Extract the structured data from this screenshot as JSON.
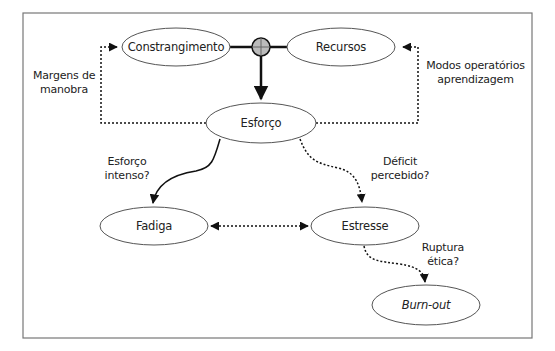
{
  "diagram": {
    "type": "flow-diagram",
    "frame": {
      "x": 23,
      "y": 13,
      "width": 509,
      "height": 325,
      "stroke": "#777777"
    },
    "nodes": [
      {
        "id": "constrangimento",
        "label": "Constrangimento",
        "cx": 176,
        "cy": 47,
        "rx": 54,
        "ry": 19
      },
      {
        "id": "recursos",
        "label": "Recursos",
        "cx": 341,
        "cy": 47,
        "rx": 54,
        "ry": 19
      },
      {
        "id": "esforco",
        "label": "Esforço",
        "cx": 261,
        "cy": 123,
        "rx": 55,
        "ry": 20
      },
      {
        "id": "fadiga",
        "label": "Fadiga",
        "cx": 154,
        "cy": 226,
        "rx": 54,
        "ry": 19
      },
      {
        "id": "estresse",
        "label": "Estresse",
        "cx": 365,
        "cy": 226,
        "rx": 54,
        "ry": 19
      },
      {
        "id": "burnout",
        "label": "Burn-out",
        "cx": 426,
        "cy": 305,
        "rx": 54,
        "ry": 20,
        "italic": true
      }
    ],
    "junction": {
      "cx": 261,
      "cy": 47,
      "r": 9,
      "fill": "#bbbbbb"
    },
    "edge_labels": {
      "margens": [
        "Margens de",
        "manobra"
      ],
      "modos": [
        "Modos operatórios",
        "aprendizagem"
      ],
      "esforco_intenso": [
        "Esforço",
        "intenso?"
      ],
      "deficit": [
        "Déficit",
        "percebido?"
      ],
      "ruptura": [
        "Ruptura",
        "ética?"
      ]
    },
    "edges": [
      {
        "from": "constrangimento",
        "to": "recursos",
        "style": "solid-thick",
        "via": "junction"
      },
      {
        "from": "junction",
        "to": "esforco",
        "style": "solid-thick",
        "arrow": "end"
      },
      {
        "from": "esforco",
        "to": "constrangimento",
        "style": "dotted",
        "label": "Margens de manobra",
        "arrow": "end"
      },
      {
        "from": "esforco",
        "to": "recursos",
        "style": "dotted",
        "label": "Modos operatórios aprendizagem",
        "arrow": "end"
      },
      {
        "from": "esforco",
        "to": "fadiga",
        "style": "solid-curve",
        "label": "Esforço intenso?",
        "arrow": "end"
      },
      {
        "from": "esforco",
        "to": "estresse",
        "style": "dotted-curve",
        "label": "Déficit percebido?",
        "arrow": "end"
      },
      {
        "from": "fadiga",
        "to": "estresse",
        "style": "dotted",
        "arrow": "both"
      },
      {
        "from": "estresse",
        "to": "burnout",
        "style": "dotted-curve",
        "label": "Ruptura ética?",
        "arrow": "end"
      }
    ],
    "colors": {
      "line": "#111111",
      "ellipse_stroke": "#555555",
      "text": "#222222"
    }
  }
}
